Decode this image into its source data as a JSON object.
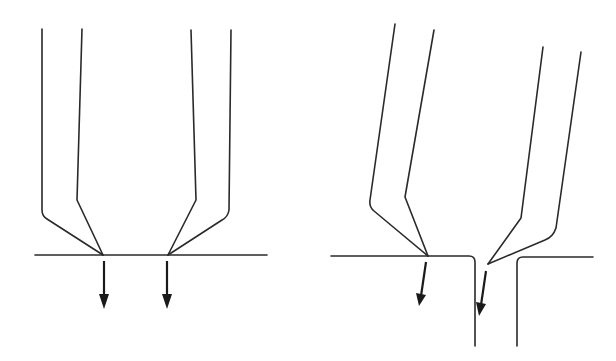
{
  "diagram": {
    "panels": [
      {
        "id": "left",
        "description": "Two beam pairs converging on flat surface; arrows pointing straight down",
        "surface": {
          "type": "flat"
        },
        "arrows": 2
      },
      {
        "id": "right",
        "description": "Two tilted beam pairs converging near a slot opening; arrows pointing down at an angle",
        "surface": {
          "type": "slot"
        },
        "arrows": 2
      }
    ],
    "colors": {
      "line": "#2a2a2a",
      "background": "#ffffff"
    }
  }
}
